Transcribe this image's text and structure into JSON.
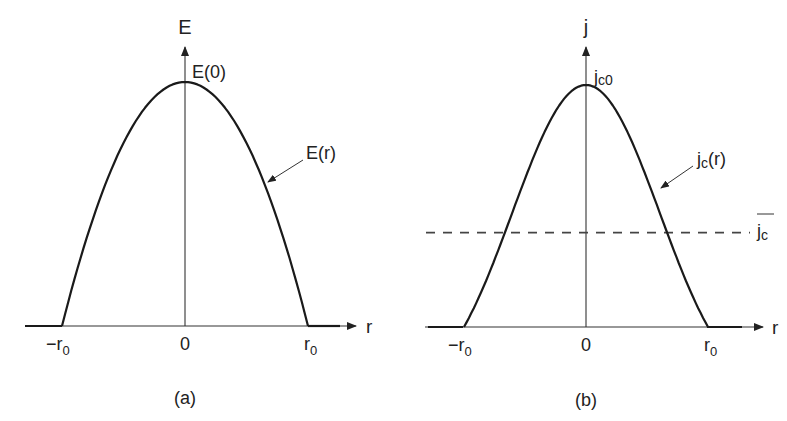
{
  "figure": {
    "panel_a": {
      "caption": "(a)",
      "y_axis_label": "E",
      "x_axis_label": "r",
      "peak_label": "E(0)",
      "curve_label": "E(r)",
      "ticks": [
        "−r",
        "0",
        "r"
      ],
      "tick_subscripts": [
        "0",
        "",
        "0"
      ],
      "profile": "parabolic",
      "description": "Electric field E(r) across a conductor of radius r0, maximum E(0) at the centre, zero beyond ±r0"
    },
    "panel_b": {
      "caption": "(b)",
      "y_axis_label": "j",
      "x_axis_label": "r",
      "peak_label_main": "j",
      "peak_label_sub": "c0",
      "curve_label_main": "j",
      "curve_label_sub": "c",
      "curve_label_tail": "(r)",
      "mean_label_main": "j",
      "mean_label_sub": "c",
      "ticks": [
        "−r",
        "0",
        "r"
      ],
      "tick_subscripts": [
        "0",
        "",
        "0"
      ],
      "profile": "bell-shaped",
      "mean_line_fraction_of_peak": 0.39,
      "description": "Critical current density jc(r) with peak jc0 at centre and dashed line showing the mean value j̄c"
    }
  }
}
